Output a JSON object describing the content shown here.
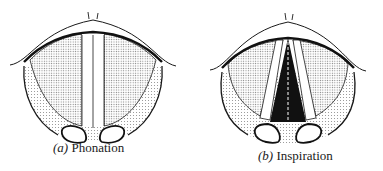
{
  "figure": {
    "panels": [
      {
        "id": "a",
        "letter": "(a)",
        "label": "Phonation",
        "glottis_state": "closed"
      },
      {
        "id": "b",
        "letter": "(b)",
        "label": "Inspiration",
        "glottis_state": "open"
      }
    ],
    "colors": {
      "ink": "#1a1a1a",
      "stipple": "#8a8a8a",
      "glottis_open": "#111111",
      "paper": "#ffffff"
    }
  }
}
